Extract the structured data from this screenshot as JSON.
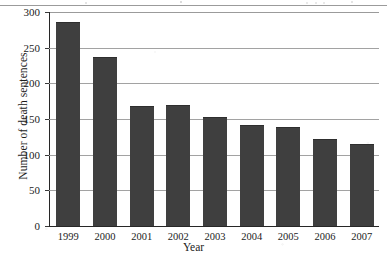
{
  "chart_data": {
    "type": "bar",
    "title": "",
    "subtitle": "",
    "xlabel": "Year",
    "ylabel": "Number of death sentences",
    "categories": [
      "1999",
      "2000",
      "2001",
      "2002",
      "2003",
      "2004",
      "2005",
      "2006",
      "2007"
    ],
    "values": [
      284,
      236,
      167,
      168,
      152,
      140,
      138,
      120,
      113
    ],
    "series": [
      {
        "name": "Number of death sentences",
        "values": [
          284,
          236,
          167,
          168,
          152,
          140,
          138,
          120,
          113
        ]
      }
    ],
    "ylim": [
      0,
      300
    ],
    "ytick_labels": [
      "0",
      "50",
      "100",
      "150",
      "200",
      "250",
      "300"
    ],
    "ytick_values": [
      0,
      50,
      100,
      150,
      200,
      250,
      300
    ],
    "grid": "horizontal",
    "legend": "none",
    "bar_color": "#3f3f3f",
    "grid_color": "#a2a2a2",
    "axis_color": "#272727",
    "background_color": "#ffffff"
  }
}
